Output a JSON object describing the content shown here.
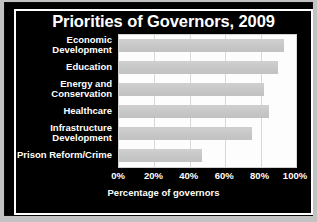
{
  "chart_data": {
    "type": "bar",
    "orientation": "horizontal",
    "title": "Priorities of Governors, 2009",
    "xlabel": "Percentage of governors",
    "ylabel": "",
    "categories": [
      "Economic Development",
      "Education",
      "Energy and Conservation",
      "Healthcare",
      "Infrastructure Development",
      "Prison Reform/Crime"
    ],
    "category_lines": [
      [
        "Economic",
        "Development"
      ],
      [
        "Education"
      ],
      [
        "Energy and",
        "Conservation"
      ],
      [
        "Healthcare"
      ],
      [
        "Infrastructure",
        "Development"
      ],
      [
        "Prison Reform/Crime"
      ]
    ],
    "values": [
      93,
      90,
      82,
      85,
      75,
      47
    ],
    "xlim": [
      0,
      100
    ],
    "xticks": [
      0,
      20,
      40,
      60,
      80,
      100
    ],
    "xtick_labels": [
      "0%",
      "20%",
      "40%",
      "60%",
      "80%",
      "100%"
    ],
    "grid": true,
    "legend": false,
    "colors": {
      "background": "#000000",
      "plot_background": "#fdfdfd",
      "bar": "#c9c9c9",
      "text": "#ffffff",
      "gridline": "#d8d8d8",
      "frame": "#ffffff"
    }
  }
}
